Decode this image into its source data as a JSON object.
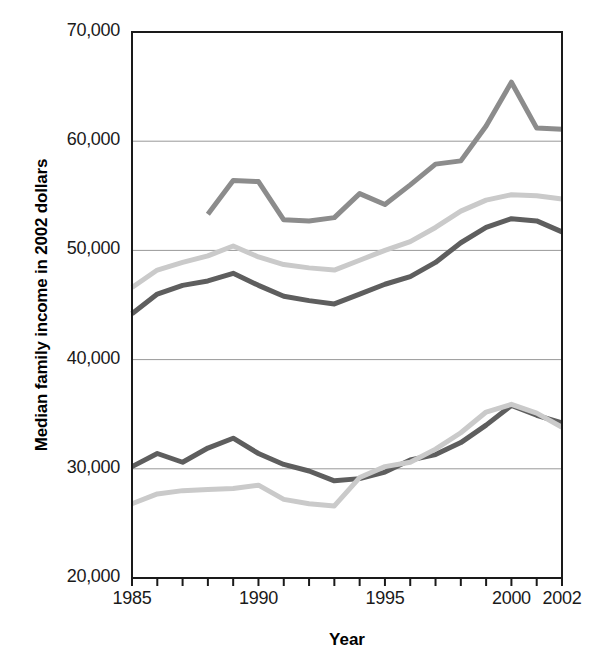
{
  "chart_data": {
    "type": "line",
    "title": "",
    "xlabel": "Year",
    "ylabel": "Median family income in 2002 dollars",
    "xlim": [
      1985,
      2002
    ],
    "ylim": [
      20000,
      70000
    ],
    "grid": true,
    "legend_position": "inline-annotations",
    "y_ticks": [
      20000,
      30000,
      40000,
      50000,
      60000,
      70000
    ],
    "y_tick_labels": [
      "20,000",
      "30,000",
      "40,000",
      "50,000",
      "60,000",
      "70,000"
    ],
    "x_ticks": [
      1985,
      1986,
      1987,
      1988,
      1989,
      1990,
      1991,
      1992,
      1993,
      1994,
      1995,
      1996,
      1997,
      1998,
      1999,
      2000,
      2001,
      2002
    ],
    "x_tick_labels_shown": [
      "1985",
      "1990",
      "1995",
      "2000",
      "2002"
    ],
    "x_tick_labels_shown_values": [
      1985,
      1990,
      1995,
      2000,
      2002
    ],
    "series": [
      {
        "name": "Asians, Pacific Islanders",
        "color": "#8c8c8c",
        "x": [
          1988,
          1989,
          1990,
          1991,
          1992,
          1993,
          1994,
          1995,
          1996,
          1997,
          1998,
          1999,
          2000,
          2001,
          2002
        ],
        "values": [
          53300,
          56400,
          56300,
          52800,
          52700,
          53000,
          55200,
          54200,
          56000,
          57900,
          58200,
          61400,
          65400,
          61200,
          61100
        ]
      },
      {
        "name": "Whites",
        "color": "#cacaca",
        "x": [
          1985,
          1986,
          1987,
          1988,
          1989,
          1990,
          1991,
          1992,
          1993,
          1994,
          1995,
          1996,
          1997,
          1998,
          1999,
          2000,
          2001,
          2002
        ],
        "values": [
          46600,
          48200,
          48900,
          49500,
          50400,
          49400,
          48700,
          48400,
          48200,
          49100,
          50000,
          50800,
          52100,
          53600,
          54600,
          55100,
          55000,
          54700
        ]
      },
      {
        "name": "All families",
        "color": "#5e5e5e",
        "x": [
          1985,
          1986,
          1987,
          1988,
          1989,
          1990,
          1991,
          1992,
          1993,
          1994,
          1995,
          1996,
          1997,
          1998,
          1999,
          2000,
          2001,
          2002
        ],
        "values": [
          44200,
          46000,
          46800,
          47200,
          47900,
          46800,
          45800,
          45400,
          45100,
          46000,
          46900,
          47600,
          48900,
          50700,
          52100,
          52900,
          52700,
          51700
        ]
      },
      {
        "name": "Hispanics",
        "color": "#5e5e5e",
        "x": [
          1985,
          1986,
          1987,
          1988,
          1989,
          1990,
          1991,
          1992,
          1993,
          1994,
          1995,
          1996,
          1997,
          1998,
          1999,
          2000,
          2001,
          2002
        ],
        "values": [
          30200,
          31400,
          30600,
          31900,
          32800,
          31400,
          30400,
          29800,
          28900,
          29100,
          29700,
          30800,
          31300,
          32400,
          34000,
          35800,
          34900,
          34200
        ]
      },
      {
        "name": "African Americans",
        "color": "#cacaca",
        "x": [
          1985,
          1986,
          1987,
          1988,
          1989,
          1990,
          1991,
          1992,
          1993,
          1994,
          1995,
          1996,
          1997,
          1998,
          1999,
          2000,
          2001,
          2002
        ],
        "values": [
          26800,
          27700,
          28000,
          28100,
          28200,
          28500,
          27200,
          26800,
          26600,
          29200,
          30200,
          30600,
          31800,
          33300,
          35200,
          35900,
          35100,
          33800
        ]
      }
    ],
    "annotations": [
      {
        "text": "Asians, Pacific Islanders",
        "x": 1992.1,
        "y": 62600
      },
      {
        "text": "Whites",
        "x": 1992.2,
        "y": 51900
      },
      {
        "text": "All families",
        "x": 1994.6,
        "y": 47200
      },
      {
        "text": "Hispanics",
        "x": 1985.6,
        "y": 32600
      },
      {
        "text": "African Americans",
        "x": 1986.0,
        "y": 26400
      }
    ]
  },
  "axis": {
    "x_title": "Year",
    "y_title": "Median family income in 2002 dollars"
  }
}
